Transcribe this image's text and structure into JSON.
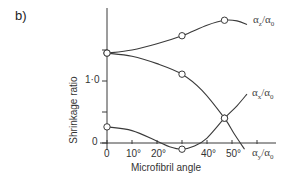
{
  "panel_label": "b)",
  "chart_data": {
    "type": "line",
    "title": "",
    "panel": "b)",
    "xlabel": "Microfibril angle",
    "ylabel": "Shrinkage ratio",
    "xlim": [
      0,
      68
    ],
    "ylim": [
      -0.15,
      2.1
    ],
    "x_ticks": [
      0,
      10,
      20,
      30,
      40,
      50,
      60
    ],
    "x_tick_labels": [
      "0",
      "10°",
      "20°",
      "",
      "40°",
      "50°",
      ""
    ],
    "y_ticks": [
      0,
      0.5,
      1.0,
      1.5
    ],
    "y_tick_labels": [
      "0",
      "",
      "1·0",
      ""
    ],
    "grid": false,
    "legend": "inline labels at curve ends",
    "series": [
      {
        "name": "αz/α0",
        "label_main": "α",
        "label_sub": "z",
        "label_den": "α",
        "label_den_sub": "0",
        "markers": [
          [
            0,
            1.45
          ],
          [
            30,
            1.73
          ],
          [
            47,
            1.98
          ]
        ],
        "curve": [
          [
            0,
            1.45
          ],
          [
            10,
            1.5
          ],
          [
            20,
            1.6
          ],
          [
            30,
            1.73
          ],
          [
            40,
            1.9
          ],
          [
            47,
            1.98
          ],
          [
            52,
            1.97
          ],
          [
            56,
            1.91
          ]
        ]
      },
      {
        "name": "αx/α0",
        "label_main": "α",
        "label_sub": "x",
        "label_den": "α",
        "label_den_sub": "0",
        "markers": [
          [
            0,
            0.26
          ],
          [
            30,
            -0.1
          ],
          [
            47,
            0.4
          ]
        ],
        "curve": [
          [
            0,
            0.26
          ],
          [
            10,
            0.2
          ],
          [
            20,
            0.03
          ],
          [
            25,
            -0.06
          ],
          [
            30,
            -0.1
          ],
          [
            35,
            -0.05
          ],
          [
            40,
            0.08
          ],
          [
            47,
            0.4
          ],
          [
            52,
            0.6
          ],
          [
            56,
            0.79
          ]
        ]
      },
      {
        "name": "αy/α0",
        "label_main": "α",
        "label_sub": "y",
        "label_den": "α",
        "label_den_sub": "0",
        "markers": [
          [
            0,
            1.45
          ],
          [
            30,
            1.11
          ],
          [
            47,
            0.4
          ]
        ],
        "curve": [
          [
            0,
            1.45
          ],
          [
            10,
            1.4
          ],
          [
            20,
            1.28
          ],
          [
            30,
            1.11
          ],
          [
            38,
            0.85
          ],
          [
            47,
            0.4
          ],
          [
            51,
            0.14
          ],
          [
            55,
            -0.1
          ]
        ]
      }
    ]
  }
}
